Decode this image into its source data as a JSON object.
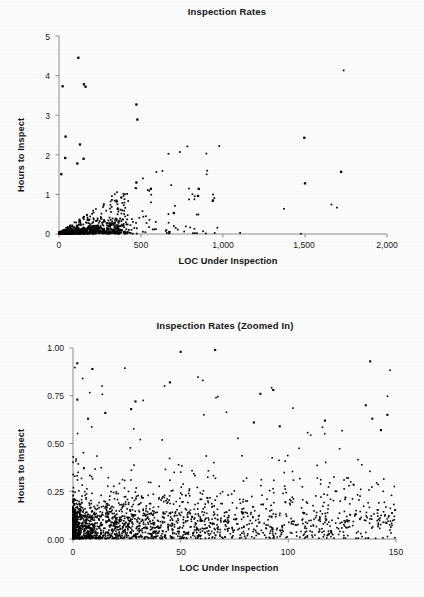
{
  "page": {
    "background_color": "#fdfdfd",
    "ink_color": "#141414"
  },
  "charts": [
    {
      "id": "inspection-rates-full",
      "title": "Inspection Rates",
      "xlabel": "LOC Under Inspection",
      "ylabel": "Hours to Inspect",
      "x_ticks": [
        "0",
        "500",
        "1,000",
        "1,500",
        "2,000"
      ],
      "y_ticks": [
        "0",
        "1",
        "2",
        "3",
        "4",
        "5"
      ]
    },
    {
      "id": "inspection-rates-zoomed",
      "title": "Inspection Rates (Zoomed In)",
      "xlabel": "LOC Under Inspection",
      "ylabel": "Hours to Inspect",
      "x_ticks": [
        "0",
        "50",
        "100",
        "150"
      ],
      "y_ticks": [
        "0.00",
        "0.25",
        "0.50",
        "0.75",
        "1.00"
      ]
    }
  ],
  "chart_data": [
    {
      "type": "scatter",
      "id": "inspection-rates-full",
      "title": "Inspection Rates",
      "xlabel": "LOC Under Inspection",
      "ylabel": "Hours to Inspect",
      "xlim": [
        0,
        2000
      ],
      "ylim": [
        0,
        5
      ],
      "xticks": [
        0,
        500,
        1000,
        1500,
        2000
      ],
      "xticklabels": [
        "0",
        "500",
        "1,000",
        "1,500",
        "2,000"
      ],
      "yticks": [
        0,
        1,
        2,
        3,
        4,
        5
      ],
      "yticklabels": [
        "0",
        "1",
        "2",
        "3",
        "4",
        "5"
      ],
      "grid": false,
      "legend": null,
      "marker": "dot",
      "marker_color": "#000000",
      "notes": "Dense wedge of points hugging the origin; ~900 points, most below 0.5 h and under 400 LOC. A handful of high outliers and three far-right isolated points.",
      "outliers": [
        {
          "x": 118,
          "y": 4.45
        },
        {
          "x": 22,
          "y": 3.73
        },
        {
          "x": 152,
          "y": 3.78
        },
        {
          "x": 162,
          "y": 3.72
        },
        {
          "x": 472,
          "y": 3.27
        },
        {
          "x": 478,
          "y": 2.89
        },
        {
          "x": 40,
          "y": 2.46
        },
        {
          "x": 128,
          "y": 2.26
        },
        {
          "x": 38,
          "y": 1.92
        },
        {
          "x": 150,
          "y": 1.9
        },
        {
          "x": 112,
          "y": 1.78
        },
        {
          "x": 1496,
          "y": 2.43
        },
        {
          "x": 1720,
          "y": 1.57
        },
        {
          "x": 1500,
          "y": 1.28
        },
        {
          "x": 852,
          "y": 1.14
        },
        {
          "x": 848,
          "y": 0.96
        },
        {
          "x": 938,
          "y": 0.84
        },
        {
          "x": 700,
          "y": 0.53
        },
        {
          "x": 14,
          "y": 1.51
        },
        {
          "x": 560,
          "y": 1.14
        },
        {
          "x": 472,
          "y": 1.3
        }
      ],
      "cloud": {
        "n": 880,
        "x_distribution": "heavy-right-skew, mode near 40, 95% below 400",
        "y_model": "y roughly proportional to x with wide spread; y = x/1000 * u, u in [0,3]",
        "y_floor": 0.01
      }
    },
    {
      "type": "scatter",
      "id": "inspection-rates-zoomed",
      "title": "Inspection Rates (Zoomed In)",
      "xlabel": "LOC Under Inspection",
      "ylabel": "Hours to Inspect",
      "xlim": [
        0,
        150
      ],
      "ylim": [
        0,
        1.0
      ],
      "xticks": [
        0,
        50,
        100,
        150
      ],
      "xticklabels": [
        "0",
        "50",
        "100",
        "150"
      ],
      "yticks": [
        0.0,
        0.25,
        0.5,
        0.75,
        1.0
      ],
      "yticklabels": [
        "0.00",
        "0.25",
        "0.50",
        "0.75",
        "1.00"
      ],
      "grid": false,
      "legend": null,
      "marker": "dot",
      "marker_color": "#000000",
      "notes": "Same data magnified to 0-150 LOC and 0-1.00 hours. Very dense band below 0.20 h, densest for LOC < 30; scatter thins upward, a few points reach 0.93-0.99.",
      "outliers": [
        {
          "x": 50,
          "y": 0.98
        },
        {
          "x": 66,
          "y": 0.99
        },
        {
          "x": 138,
          "y": 0.93
        },
        {
          "x": 2,
          "y": 0.92
        },
        {
          "x": 9,
          "y": 0.89
        },
        {
          "x": 45,
          "y": 0.82
        },
        {
          "x": 93,
          "y": 0.78
        },
        {
          "x": 87,
          "y": 0.76
        },
        {
          "x": 2,
          "y": 0.73
        },
        {
          "x": 29,
          "y": 0.72
        },
        {
          "x": 136,
          "y": 0.7
        },
        {
          "x": 15,
          "y": 0.66
        },
        {
          "x": 146,
          "y": 0.65
        },
        {
          "x": 27,
          "y": 0.68
        },
        {
          "x": 139,
          "y": 0.63
        },
        {
          "x": 117,
          "y": 0.62
        },
        {
          "x": 84,
          "y": 0.61
        },
        {
          "x": 7,
          "y": 0.63
        },
        {
          "x": 96,
          "y": 0.59
        },
        {
          "x": 143,
          "y": 0.57
        }
      ],
      "cloud": {
        "n": 1150,
        "x_distribution": "heavy-right-skew, densest below 30 LOC, sparse tail to 150",
        "y_model": "mostly 0.00-0.20, thinning tail to 1.00",
        "y_floor": 0.005
      }
    }
  ]
}
